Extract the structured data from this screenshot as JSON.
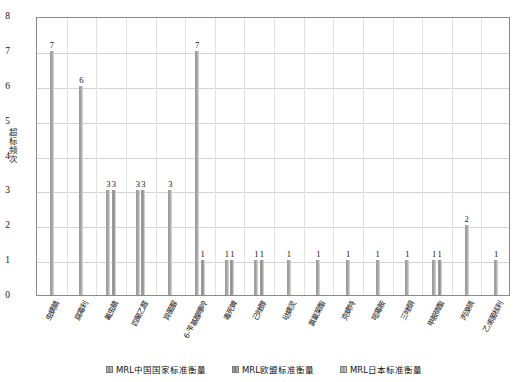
{
  "chart_data": {
    "type": "bar",
    "title": "",
    "xlabel": "",
    "ylabel": "超标频次",
    "ylim": [
      0,
      8
    ],
    "yticks": [
      "0",
      "1",
      "2",
      "3",
      "4",
      "5",
      "6",
      "7",
      "8"
    ],
    "grid": true,
    "legend_position": "bottom",
    "categories": [
      "虫螨腈",
      "腐霉利",
      "氟虫腈",
      "四聚乙醛",
      "异菌脲",
      "6-苄基腺嘌呤",
      "毒死蜱",
      "己唑醇",
      "哒螨灵",
      "氯氰菊酯",
      "克螨特",
      "嘧霉胺",
      "三唑酮",
      "甲胺磷酯",
      "丙溴磷",
      "乙烯菌核利"
    ],
    "series": [
      {
        "name": "MRL中国国家标准衡量",
        "color": "#8f8f8f",
        "values": [
          7,
          6,
          3,
          3,
          3,
          7,
          1,
          1,
          1,
          1,
          1,
          1,
          1,
          1,
          2,
          1
        ]
      },
      {
        "name": "MRL欧盟标准衡量",
        "color": "#7d7d7d",
        "values": [
          0,
          0,
          3,
          3,
          0,
          1,
          1,
          1,
          0,
          0,
          0,
          0,
          0,
          1,
          0,
          0
        ]
      },
      {
        "name": "MRL日本标准衡量",
        "color": "#9b9b9b",
        "values": [
          0,
          0,
          0,
          0,
          0,
          0,
          0,
          0,
          0,
          0,
          0,
          0,
          0,
          0,
          0,
          0
        ]
      }
    ],
    "bar_labels": [
      [
        "7"
      ],
      [
        "6"
      ],
      [
        "3",
        "3"
      ],
      [
        "3",
        "3"
      ],
      [
        "3"
      ],
      [
        "7",
        "1"
      ],
      [
        "1",
        "1"
      ],
      [
        "1",
        "1"
      ],
      [
        "1"
      ],
      [
        "1"
      ],
      [
        "1"
      ],
      [
        "1"
      ],
      [
        "1"
      ],
      [
        "1",
        "1"
      ],
      [
        "2"
      ],
      [
        "1"
      ]
    ]
  },
  "legend": {
    "items": [
      {
        "label": "MRL中国国家标准衡量"
      },
      {
        "label": "MRL欧盟标准衡量"
      },
      {
        "label": "MRL日本标准衡量"
      }
    ]
  }
}
